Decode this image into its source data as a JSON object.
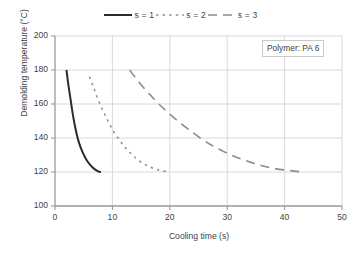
{
  "chart_data": {
    "type": "line",
    "title": "",
    "xlabel": "Cooling time (s)",
    "ylabel": "Demolding temperature (°C)",
    "xlim": [
      0,
      50
    ],
    "ylim": [
      100,
      200
    ],
    "xticks": [
      "0",
      "10",
      "20",
      "30",
      "40",
      "50"
    ],
    "yticks": [
      "100",
      "120",
      "140",
      "160",
      "180",
      "200"
    ],
    "grid": "both",
    "legend_position": "top-center",
    "annotation": "Polymer: PA 6",
    "series": [
      {
        "name": "s = 1",
        "style": "solid",
        "color": "#2b2b2b",
        "x": [
          2.0,
          2.3,
          2.7,
          3.1,
          3.6,
          4.2,
          4.9,
          5.7,
          6.6,
          7.5,
          8.0
        ],
        "y": [
          180,
          172,
          163,
          154,
          145,
          137,
          131,
          126,
          122.5,
          120.4,
          120
        ]
      },
      {
        "name": "s = 2",
        "style": "dotted",
        "color": "#8c8c8c",
        "x": [
          6.0,
          6.8,
          7.7,
          8.8,
          10.0,
          11.4,
          12.9,
          14.5,
          16.2,
          18.0,
          20.0
        ],
        "y": [
          176,
          169,
          161,
          153,
          145,
          138,
          132,
          127,
          123.5,
          121.2,
          120
        ]
      },
      {
        "name": "s = 3",
        "style": "dashed",
        "color": "#8c8c8c",
        "x": [
          13.0,
          14.6,
          16.4,
          18.4,
          20.7,
          23.3,
          26.2,
          29.4,
          33.0,
          37.5,
          43.0
        ],
        "y": [
          180,
          173,
          166,
          159,
          152,
          145,
          138,
          132,
          127,
          122.5,
          120
        ]
      }
    ]
  },
  "legend": {
    "entries": [
      {
        "label": "s = 1"
      },
      {
        "label": "s = 2"
      },
      {
        "label": "s = 3"
      }
    ]
  },
  "axes": {
    "ylabel": "Demolding temperature (°C)",
    "xlabel": "Cooling time (s)",
    "yticks": [
      "200",
      "180",
      "160",
      "140",
      "120",
      "100"
    ],
    "xticks": [
      "0",
      "10",
      "20",
      "30",
      "40",
      "50"
    ]
  },
  "annotation": {
    "text": "Polymer: PA 6"
  },
  "colors": {
    "series_1": "#2b2b2b",
    "series_2": "#8c8c8c",
    "series_3": "#8c8c8c",
    "axis": "#999999",
    "grid": "#d9d9d9",
    "text": "#3f3f3f",
    "background": "#ffffff"
  }
}
